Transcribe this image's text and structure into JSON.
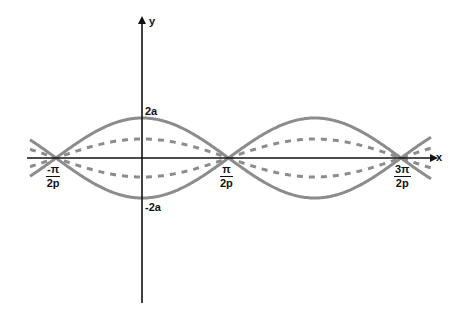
{
  "diagram": {
    "axes": {
      "x_label": "x",
      "y_label": "y"
    },
    "y_ticks": [
      {
        "label": "2a",
        "value": "2a"
      },
      {
        "label": "-2a",
        "value": "-2a"
      }
    ],
    "x_ticks": [
      {
        "numerator": "-π",
        "denominator": "2p"
      },
      {
        "numerator": "π",
        "denominator": "2p"
      },
      {
        "numerator": "3π",
        "denominator": "2p"
      }
    ],
    "curves": [
      {
        "name": "envelope-upper",
        "style": "solid",
        "amplitude": "2a",
        "color": "#8c8c8c"
      },
      {
        "name": "envelope-lower",
        "style": "solid",
        "amplitude": "-2a",
        "color": "#8c8c8c"
      },
      {
        "name": "wave-upper",
        "style": "dashed",
        "amplitude": "a",
        "color": "#8c8c8c"
      },
      {
        "name": "wave-lower",
        "style": "dashed",
        "amplitude": "-a",
        "color": "#8c8c8c"
      }
    ],
    "colors": {
      "axis": "#111111",
      "curve": "#8c8c8c"
    }
  }
}
